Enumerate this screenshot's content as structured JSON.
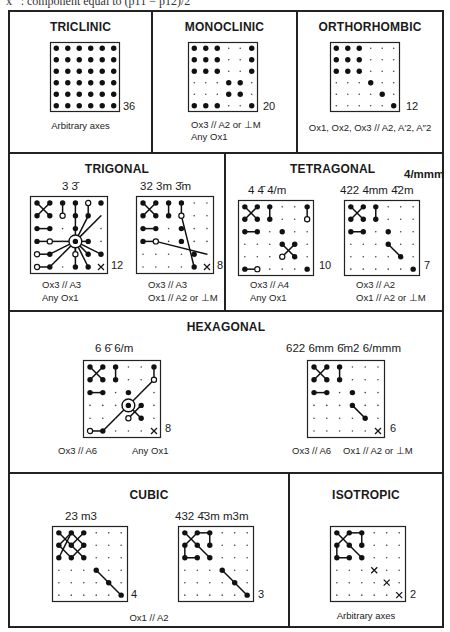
{
  "top_caption": "x ′ : component equal to (p11 − p12)/2",
  "panels": {
    "triclinic": {
      "title": "TRICLINIC",
      "grids": [
        {
          "symbols": "",
          "count": "36",
          "note": "Arbitrary axes",
          "cells": [
            "BBBBBB",
            "BBBBBB",
            "BBBBBB",
            "BBBBBB",
            "BBBBBB",
            "BBBBBB"
          ],
          "lines": []
        }
      ]
    },
    "monoclinic": {
      "title": "MONOCLINIC",
      "grids": [
        {
          "symbols": "",
          "count": "20",
          "note_line1": "Ox3 // A2 or ⊥M",
          "note_line2": "Any Ox1",
          "cells": [
            "BBB..B",
            "BBB..B",
            "BBB..B",
            "...BB.",
            "...BB.",
            "BBB..B"
          ],
          "lines": []
        }
      ]
    },
    "orthorhombic": {
      "title": "ORTHORHOMBIC",
      "grids": [
        {
          "symbols": "",
          "count": "12",
          "note": "Ox1, Ox2, Ox3 // A2, A′2, A″2",
          "cells": [
            "BBB...",
            "BBB...",
            "BBB...",
            "...B..",
            "....B.",
            ".....B"
          ],
          "lines": []
        }
      ]
    },
    "trigonal": {
      "title": "TRIGONAL",
      "grids": [
        {
          "symbols": "3  3̄",
          "count": "12",
          "note_line1": "Ox3 // A3",
          "note_line2": "Any Ox1",
          "cells": [
            "BBBBOB",
            "BBOBB.",
            "BB.B..",
            "BO.BB.",
            "OB.OBB",
            "OB.BBX"
          ],
          "ring": [
            3,
            3
          ],
          "lines": [
            [
              0,
              0,
              1,
              1
            ],
            [
              1,
              0,
              0,
              1
            ],
            [
              2,
              0,
              2,
              1
            ],
            [
              3,
              0,
              3,
              1
            ],
            [
              4,
              0,
              4,
              1
            ],
            [
              0,
              2,
              1,
              2
            ],
            [
              0,
              3,
              1,
              3
            ],
            [
              0,
              4,
              1,
              4
            ],
            [
              0,
              5,
              1,
              5
            ],
            [
              3,
              1,
              3,
              3
            ],
            [
              4,
              1,
              3,
              3
            ],
            [
              5,
              1,
              3,
              3
            ],
            [
              1,
              3,
              3,
              3
            ],
            [
              1,
              4,
              3,
              3
            ],
            [
              1,
              5,
              3,
              3
            ],
            [
              3,
              3,
              4,
              3
            ],
            [
              3,
              3,
              5,
              4
            ],
            [
              3,
              3,
              4,
              4
            ],
            [
              3,
              3,
              3,
              5
            ],
            [
              3,
              3,
              4,
              5
            ],
            [
              3,
              3,
              3,
              4
            ]
          ]
        },
        {
          "symbols": "32  3m  3̄m",
          "count": "8",
          "note_line1": "Ox3 // A3",
          "note_line2": "Ox1 // A2 or ⊥M",
          "cells": [
            "BBBB..",
            "BBBO..",
            "BB.B..",
            "BO.B..",
            "....B.",
            "....BX"
          ],
          "lines": [
            [
              0,
              0,
              1,
              1
            ],
            [
              1,
              0,
              0,
              1
            ],
            [
              2,
              0,
              2,
              1
            ],
            [
              3,
              0,
              3,
              1
            ],
            [
              0,
              2,
              1,
              2
            ],
            [
              0,
              3,
              1,
              3
            ],
            [
              3,
              1,
              4,
              5
            ],
            [
              1,
              3,
              5,
              4
            ]
          ]
        }
      ]
    },
    "tetragonal": {
      "title": "TETRAGONAL",
      "grids": [
        {
          "symbols": "4  4̄  4/m",
          "count": "10",
          "note_line1": "Ox3 // A4",
          "note_line2": "Any Ox1",
          "cells": [
            "BBB..B",
            "BBB..O",
            "BB.B..",
            "...BB.",
            "...OB.",
            "BO...B"
          ],
          "lines": [
            [
              0,
              0,
              1,
              1
            ],
            [
              1,
              0,
              0,
              1
            ],
            [
              2,
              0,
              2,
              1
            ],
            [
              5,
              0,
              5,
              1
            ],
            [
              0,
              2,
              1,
              2
            ],
            [
              3,
              3,
              4,
              4
            ],
            [
              4,
              3,
              3,
              4
            ],
            [
              0,
              5,
              1,
              5
            ]
          ]
        },
        {
          "symbols": "422  4mm  4̄2m",
          "symbols_extra": "4/mmm",
          "count": "7",
          "note_line1": "Ox3 // A2",
          "note_line2": "Ox1 // A2 or ⊥M",
          "cells": [
            "BBB...",
            "BBB...",
            "BB.B..",
            "...B..",
            "....B.",
            ".....B"
          ],
          "lines": [
            [
              0,
              0,
              1,
              1
            ],
            [
              1,
              0,
              0,
              1
            ],
            [
              2,
              0,
              2,
              1
            ],
            [
              0,
              2,
              1,
              2
            ],
            [
              3,
              3,
              4,
              4
            ]
          ]
        }
      ]
    },
    "hexagonal": {
      "title": "HEXAGONAL",
      "grids": [
        {
          "symbols": "6  6̄  6/m",
          "count": "8",
          "note_left": "Ox3 // A6",
          "note_right": "Any Ox1",
          "cells": [
            "BBB..B",
            "BBB..O",
            "BB.B..",
            "...BB.",
            "...OB.",
            "OB...X"
          ],
          "ring": [
            3,
            3
          ],
          "lines": [
            [
              0,
              0,
              1,
              1
            ],
            [
              1,
              0,
              0,
              1
            ],
            [
              2,
              0,
              2,
              1
            ],
            [
              5,
              0,
              5,
              1
            ],
            [
              0,
              2,
              1,
              2
            ],
            [
              3,
              3,
              4,
              4
            ],
            [
              4,
              3,
              3,
              4
            ],
            [
              0,
              5,
              1,
              5
            ],
            [
              1,
              5,
              5,
              1
            ]
          ]
        },
        {
          "symbols": "622  6mm  6̄m2  6/mmm",
          "count": "6",
          "note_left": "Ox3 // A6",
          "note_right": "Ox1 // A2 or ⊥M",
          "cells": [
            "BBB...",
            "BBB...",
            "BB.B..",
            "...B..",
            "....B.",
            ".....X"
          ],
          "lines": [
            [
              0,
              0,
              1,
              1
            ],
            [
              1,
              0,
              0,
              1
            ],
            [
              2,
              0,
              2,
              1
            ],
            [
              0,
              2,
              1,
              2
            ],
            [
              3,
              3,
              4,
              4
            ]
          ]
        }
      ]
    },
    "cubic": {
      "title": "CUBIC",
      "note": "Ox1 // A2",
      "grids": [
        {
          "symbols": "23  m3",
          "count": "4",
          "cells": [
            "BBB...",
            "BBB...",
            "BBB...",
            "...B..",
            "....B.",
            ".....B"
          ],
          "lines": [
            [
              0,
              0,
              1,
              1
            ],
            [
              1,
              1,
              2,
              2
            ],
            [
              1,
              0,
              0,
              1
            ],
            [
              0,
              1,
              1,
              2
            ],
            [
              0,
              2,
              1,
              0
            ],
            [
              1,
              0,
              2,
              1
            ],
            [
              2,
              1,
              1,
              2
            ],
            [
              2,
              0,
              1,
              1
            ],
            [
              3,
              3,
              4,
              4
            ],
            [
              4,
              4,
              5,
              5
            ]
          ]
        },
        {
          "symbols": "432  4̄3m  m3m",
          "count": "3",
          "cells": [
            "BBB...",
            "BBB...",
            "BBB...",
            "...B..",
            "....B.",
            ".....B"
          ],
          "lines": [
            [
              0,
              0,
              2,
              2
            ],
            [
              1,
              0,
              0,
              1
            ],
            [
              0,
              1,
              0,
              2
            ],
            [
              0,
              2,
              1,
              2
            ],
            [
              1,
              0,
              2,
              0
            ],
            [
              2,
              0,
              2,
              1
            ],
            [
              3,
              3,
              4,
              4
            ],
            [
              4,
              4,
              5,
              5
            ]
          ]
        }
      ]
    },
    "isotropic": {
      "title": "ISOTROPIC",
      "grids": [
        {
          "symbols": "",
          "count": "2",
          "note": "Arbitrary axes",
          "cells": [
            "BBB...",
            "BBB...",
            "BBB...",
            "...X..",
            "....X.",
            ".....X"
          ],
          "lines": [
            [
              0,
              0,
              2,
              2
            ],
            [
              1,
              0,
              0,
              1
            ],
            [
              0,
              1,
              0,
              2
            ],
            [
              0,
              2,
              1,
              2
            ],
            [
              1,
              0,
              2,
              0
            ],
            [
              2,
              0,
              2,
              1
            ]
          ]
        }
      ]
    }
  }
}
